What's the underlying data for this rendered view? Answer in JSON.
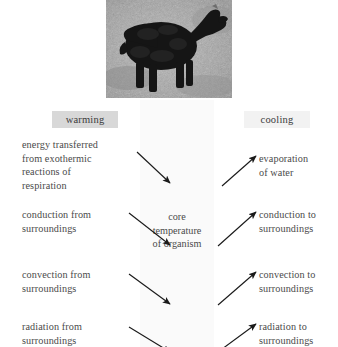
{
  "figure": {
    "photo": {
      "alt_name": "sheep-photograph",
      "description": "black-faced sheep standing on rough ground, greyscale photograph"
    },
    "headers": {
      "warming": "warming",
      "cooling": "cooling"
    },
    "centre": {
      "caption": "core\ntemperature\nof organism"
    },
    "warming_items": [
      "energy transferred\nfrom exothermic\nreactions of\nrespiration",
      "conduction from\nsurroundings",
      "convection from\nsurroundings",
      "radiation from\nsurroundings"
    ],
    "cooling_items": [
      "evaporation\nof water",
      "conduction to\nsurroundings",
      "convection to\nsurroundings",
      "radiation to\nsurroundings"
    ],
    "colors": {
      "text": "#4a4a4a",
      "warming_chip_bg": "#d8d8d8",
      "cooling_chip_bg": "#f2f2f2",
      "centre_band_bg": "#fafafa",
      "arrow": "#1a1a1a",
      "page_bg": "#ffffff"
    }
  }
}
